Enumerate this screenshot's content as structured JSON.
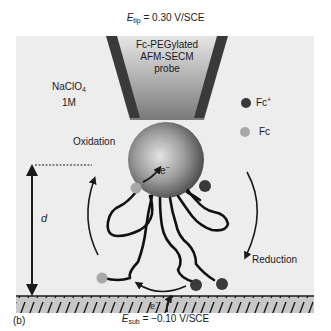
{
  "top_potential": {
    "symbol": "E",
    "subscript": "tip",
    "value": " = 0.30 V/SCE"
  },
  "bottom_potential": {
    "symbol": "E",
    "subscript": "sub",
    "value": " = −0.10 V/SCE"
  },
  "panel_label": "(b)",
  "probe": {
    "line1": "Fc-PEGylated",
    "line2": "AFM-SECM",
    "line3": "probe"
  },
  "electrolyte": {
    "line1_main": "NaClO",
    "line1_sub": "4",
    "line2": "1M"
  },
  "legend": {
    "items": [
      {
        "label_main": "Fc",
        "label_sup": "+",
        "color": "#3a3a3a"
      },
      {
        "label_main": "Fc",
        "label_sup": "",
        "color": "#a8a8a8"
      }
    ]
  },
  "process_labels": {
    "oxidation": "Oxidation",
    "reduction": "Reduction"
  },
  "distance_label": "d",
  "electron_label_tip": {
    "main": "e",
    "sup": "−"
  },
  "electron_label_sub": {
    "main": "e",
    "sup": "−"
  },
  "colors": {
    "background_panel": "#ededed",
    "substrate": "#c8c8c8",
    "probe_dark": "#3a3a3a",
    "fc_plus": "#3a3a3a",
    "fc": "#a8a8a8"
  }
}
